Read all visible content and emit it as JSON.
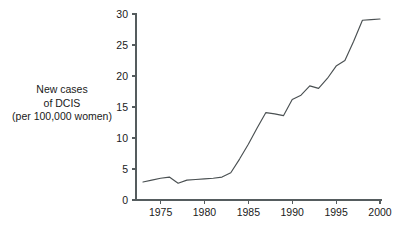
{
  "chart_data": {
    "type": "line",
    "title": "",
    "subtitle": "",
    "xlabel": "",
    "ylabel": "New cases of DCIS (per 100,000 women)",
    "ylabel_lines": [
      "New cases",
      "of DCIS",
      "(per 100,000 women)"
    ],
    "xlim": [
      1973,
      2000
    ],
    "ylim": [
      0,
      30
    ],
    "xticks": [
      1975,
      1980,
      1985,
      1990,
      1995,
      2000
    ],
    "xtick_labels": [
      "1975",
      "1980",
      "1985",
      "1990",
      "1995",
      "2000"
    ],
    "yticks": [
      0,
      5,
      10,
      15,
      20,
      25,
      30
    ],
    "ytick_labels": [
      "0",
      "5",
      "10",
      "15",
      "20",
      "25",
      "30"
    ],
    "grid": false,
    "legend": false,
    "legend_position": "none",
    "line_color": "#4a5052",
    "axis_color": "#555c5e",
    "background_color": "#ffffff",
    "x": [
      1973,
      1974,
      1975,
      1976,
      1977,
      1978,
      1979,
      1980,
      1981,
      1982,
      1983,
      1984,
      1985,
      1986,
      1987,
      1988,
      1989,
      1990,
      1991,
      1992,
      1993,
      1994,
      1995,
      1996,
      1997,
      1998,
      1999,
      2000
    ],
    "series": [
      {
        "name": "New cases of DCIS (per 100,000 women)",
        "values": [
          2.9,
          3.2,
          3.5,
          3.7,
          2.7,
          3.2,
          3.3,
          3.4,
          3.5,
          3.7,
          4.4,
          6.6,
          9.0,
          11.6,
          14.1,
          13.9,
          13.6,
          16.2,
          16.9,
          18.4,
          18.0,
          19.6,
          21.6,
          22.5,
          25.6,
          29.0,
          29.1,
          29.2
        ]
      }
    ]
  }
}
